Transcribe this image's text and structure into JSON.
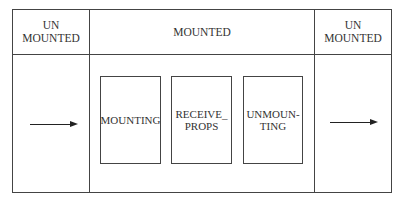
{
  "diagram": {
    "type": "lifecycle",
    "columns": [
      {
        "header": "UN\nMOUNTED",
        "content": "arrow-right"
      },
      {
        "header": "MOUNTED",
        "content": "phases"
      },
      {
        "header": "UN\nMOUNTED",
        "content": "arrow-right"
      }
    ],
    "phases": [
      {
        "label": "MOUNTING"
      },
      {
        "label": "RECEIVE_\nPROPS"
      },
      {
        "label": "UNMOUN-\nTING"
      }
    ],
    "colors": {
      "line": "#444444",
      "text": "#333333",
      "background": "#ffffff"
    }
  }
}
